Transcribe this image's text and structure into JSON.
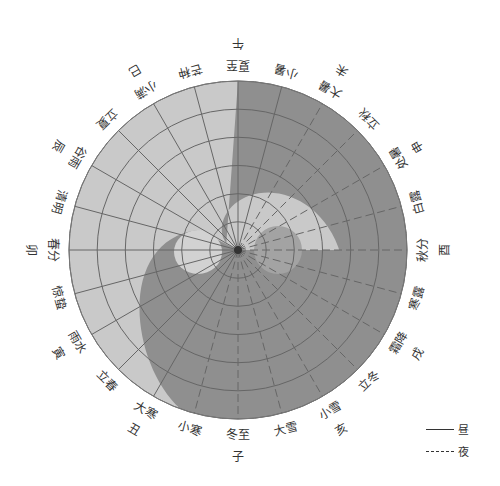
{
  "diagram": {
    "center": [
      238,
      250
    ],
    "radius": 169,
    "colors": {
      "day_fill": "#c9c9c9",
      "night_fill": "#8f8f8f",
      "grid_line": "#666666",
      "text": "#333333"
    },
    "rings": 6,
    "spokes": 24,
    "solar_terms": [
      {
        "label": "夏至",
        "angle": 0
      },
      {
        "label": "小暑",
        "angle": 15
      },
      {
        "label": "大暑",
        "angle": 30
      },
      {
        "label": "立秋",
        "angle": 45
      },
      {
        "label": "处暑",
        "angle": 60
      },
      {
        "label": "白露",
        "angle": 75
      },
      {
        "label": "秋分",
        "angle": 90
      },
      {
        "label": "寒露",
        "angle": 105
      },
      {
        "label": "霜降",
        "angle": 120
      },
      {
        "label": "立冬",
        "angle": 135
      },
      {
        "label": "小雪",
        "angle": 150
      },
      {
        "label": "大雪",
        "angle": 165
      },
      {
        "label": "冬至",
        "angle": 180
      },
      {
        "label": "小寒",
        "angle": 195
      },
      {
        "label": "大寒",
        "angle": 210
      },
      {
        "label": "立春",
        "angle": 225
      },
      {
        "label": "雨水",
        "angle": 240
      },
      {
        "label": "惊蛰",
        "angle": 255
      },
      {
        "label": "春分",
        "angle": 270
      },
      {
        "label": "清明",
        "angle": 285
      },
      {
        "label": "谷雨",
        "angle": 300
      },
      {
        "label": "立夏",
        "angle": 315
      },
      {
        "label": "小满",
        "angle": 330
      },
      {
        "label": "芒种",
        "angle": 345
      }
    ],
    "branches": [
      {
        "label": "午",
        "angle": 0
      },
      {
        "label": "未",
        "angle": 30
      },
      {
        "label": "申",
        "angle": 60
      },
      {
        "label": "酉",
        "angle": 90
      },
      {
        "label": "戌",
        "angle": 120
      },
      {
        "label": "亥",
        "angle": 150
      },
      {
        "label": "子",
        "angle": 180
      },
      {
        "label": "丑",
        "angle": 210
      },
      {
        "label": "寅",
        "angle": 240
      },
      {
        "label": "卯",
        "angle": 270
      },
      {
        "label": "辰",
        "angle": 300
      },
      {
        "label": "巳",
        "angle": 330
      }
    ]
  },
  "legend": {
    "day_label": "昼",
    "night_label": "夜"
  }
}
